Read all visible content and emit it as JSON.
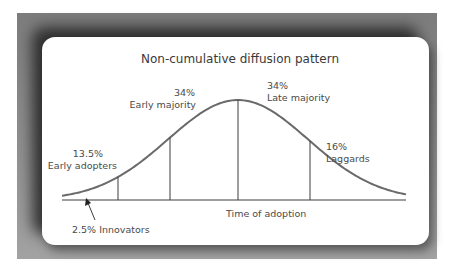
{
  "title": "Non-cumulative diffusion pattern",
  "x_axis_label": "Time of adoption",
  "segments": [
    {
      "name": "Innovators",
      "percent": "2.5%",
      "label": "2.5% Innovators"
    },
    {
      "name": "Early adopters",
      "percent": "13.5%",
      "label": "Early adopters"
    },
    {
      "name": "Early majority",
      "percent": "34%",
      "label": "Early majority"
    },
    {
      "name": "Late majority",
      "percent": "34%",
      "label": "Late majority"
    },
    {
      "name": "Laggards",
      "percent": "16%",
      "label": "Laggards"
    }
  ],
  "colors": {
    "curve": "#6a6a6a",
    "lines": "#3c3c3c",
    "text": "#4a4a4a",
    "frame": "#8a8a8a"
  }
}
